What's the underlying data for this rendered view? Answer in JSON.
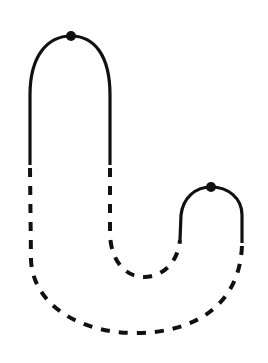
{
  "diagram": {
    "stroke_color": "#111111",
    "background": "#ffffff",
    "stroke_width": 3.2,
    "dash_pattern": "9 9",
    "dots": [
      {
        "name": "large-arch-apex-dot",
        "cx": 71,
        "cy": 36,
        "r": 5
      },
      {
        "name": "small-arch-apex-dot",
        "cx": 211,
        "cy": 187,
        "r": 5
      }
    ],
    "solid_paths": [
      {
        "name": "large-arch",
        "d": "M 30 165 L 30 95 C 30 55 48 36 71 36 C 94 36 110 55 110 95 L 110 165"
      },
      {
        "name": "small-arch",
        "d": "M 180 240 L 181 215 C 183 198 195 187 211 187 C 228 187 242 198 242 215 L 242 243"
      }
    ],
    "dashed_paths": [
      {
        "name": "inner-u-dashed",
        "d": "M 110 168 L 110 232 C 110 260 125 277 144 277 C 163 277 178 262 180 240"
      },
      {
        "name": "outer-u-dashed",
        "d": "M 30 168 L 31 260 C 33 305 80 333 135 333 C 195 333 240 305 242 245"
      }
    ]
  }
}
